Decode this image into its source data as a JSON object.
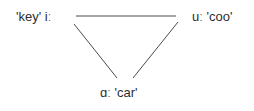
{
  "diagram": {
    "title": "",
    "nodes": [
      {
        "id": "i",
        "label": "'key' iː",
        "position": "top-left"
      },
      {
        "id": "u",
        "label": "uː 'coo'",
        "position": "top-right"
      },
      {
        "id": "a",
        "label": "ɑː 'car'",
        "position": "bottom"
      }
    ],
    "edges": [
      {
        "from": "i",
        "to": "u"
      },
      {
        "from": "i",
        "to": "a"
      },
      {
        "from": "u",
        "to": "a"
      }
    ],
    "colors": {
      "line": "#4a4a4a",
      "text": "#2e2e2e",
      "background": "#ffffff"
    }
  }
}
